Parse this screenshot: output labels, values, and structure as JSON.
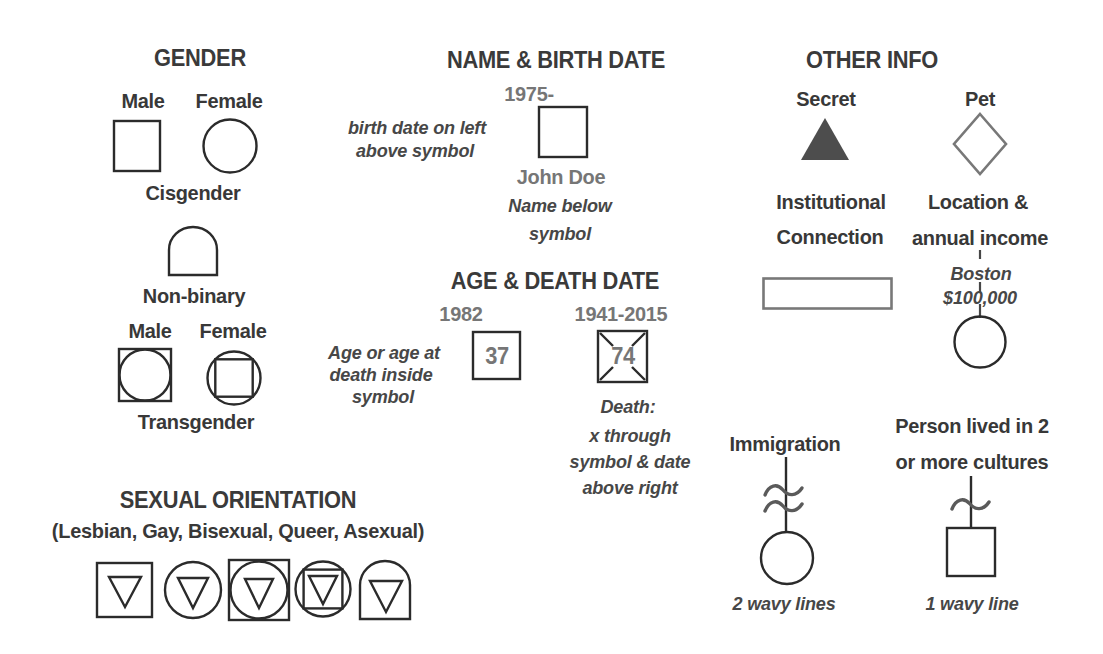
{
  "colors": {
    "background": "#ffffff",
    "heading": "#3a3a3a",
    "label": "#383838",
    "value_gray": "#767676",
    "note": "#474747",
    "symbol_stroke": "#2b2b2b",
    "gray_stroke": "#787878",
    "wave_stroke": "#5a5a5a",
    "secret_fill": "#4d4d4d"
  },
  "sections": {
    "gender": {
      "title": "GENDER",
      "cis_male_label": "Male",
      "cis_female_label": "Female",
      "cisgender_label": "Cisgender",
      "nonbinary_label": "Non-binary",
      "trans_male_label": "Male",
      "trans_female_label": "Female",
      "transgender_label": "Transgender"
    },
    "name_birth": {
      "title": "NAME & BIRTH DATE",
      "birth_date": "1975-",
      "left_note_line1": "birth date on left",
      "left_note_line2": "above symbol",
      "person_name": "John Doe",
      "below_note_line1": "Name below",
      "below_note_line2": "symbol"
    },
    "age_death": {
      "title": "AGE & DEATH DATE",
      "birth_year": "1982",
      "age_value": "37",
      "death_years": "1941-2015",
      "death_age_value": "74",
      "age_note_line1": "Age or age at",
      "age_note_line2": "death inside",
      "age_note_line3": "symbol",
      "death_note_line1": "Death:",
      "death_note_line2": "x through",
      "death_note_line3": "symbol & date",
      "death_note_line4": "above right"
    },
    "sexual_orientation": {
      "title": "SEXUAL ORIENTATION",
      "subtitle": "(Lesbian, Gay, Bisexual, Queer, Asexual)"
    },
    "other_info": {
      "title": "OTHER INFO",
      "secret_label": "Secret",
      "pet_label": "Pet",
      "institutional_line1": "Institutional",
      "institutional_line2": "Connection",
      "location_line1": "Location &",
      "location_line2": "annual income",
      "location_city": "Boston",
      "location_income": "$100,000",
      "immigration_label": "Immigration",
      "immigration_note": "2 wavy lines",
      "cultures_line1": "Person lived in 2",
      "cultures_line2": "or more cultures",
      "cultures_note": "1 wavy line"
    }
  }
}
